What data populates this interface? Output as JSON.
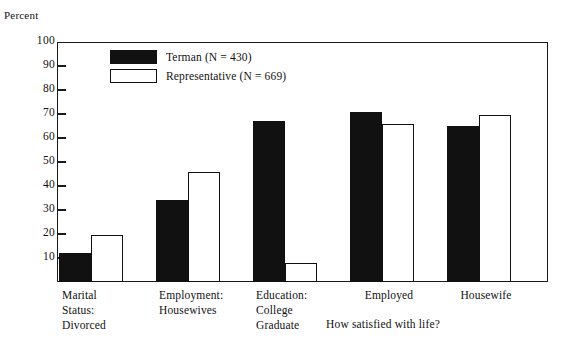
{
  "chart_data": {
    "type": "bar",
    "title": "",
    "ylabel": "Percent",
    "xlabel": "",
    "xcaption": "How satisfied with life?",
    "ylim": [
      0,
      100
    ],
    "yticks": [
      100,
      90,
      80,
      70,
      60,
      50,
      40,
      30,
      20,
      10
    ],
    "ytick_labels": [
      "100",
      "90",
      "80",
      "70",
      "60",
      "50",
      "40",
      "30",
      "20",
      "10"
    ],
    "grid": false,
    "legend_position": "upper-left-inside",
    "categories": [
      "Marital Status: Divorced",
      "Employment: Housewives",
      "Education: College Graduate",
      "Employed",
      "Housewife"
    ],
    "category_lines": [
      [
        "Marital",
        "Status:",
        "Divorced"
      ],
      [
        "Employment:",
        "Housewives"
      ],
      [
        "Education:",
        "College",
        "Graduate"
      ],
      [
        "Employed"
      ],
      [
        "Housewife"
      ]
    ],
    "series": [
      {
        "name": "Terman (N = 430)",
        "color": "#111111",
        "style": "filled",
        "values": [
          12,
          34,
          67,
          71,
          65
        ]
      },
      {
        "name": "Representative (N = 669)",
        "color": "#ffffff",
        "style": "open",
        "values": [
          19.5,
          46,
          8,
          66,
          69.5
        ]
      }
    ]
  },
  "legend": {
    "items": [
      {
        "label": "Terman (N = 430)",
        "swatch": "filled"
      },
      {
        "label": "Representative (N = 669)",
        "swatch": "open"
      }
    ]
  }
}
